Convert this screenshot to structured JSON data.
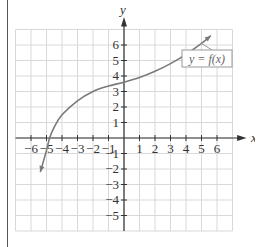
{
  "chart_data": {
    "type": "line",
    "title": "",
    "xlabel": "x",
    "ylabel": "y",
    "xlim": [
      -7,
      7
    ],
    "ylim": [
      -6,
      7
    ],
    "grid": true,
    "x_ticks": [
      -6,
      -5,
      -4,
      -3,
      -2,
      -1,
      1,
      2,
      3,
      4,
      5,
      6
    ],
    "y_ticks": [
      -5,
      -4,
      -3,
      -2,
      -1,
      1,
      2,
      3,
      4,
      5,
      6
    ],
    "x_tick_labels": [
      "−6",
      "−5",
      "−4",
      "−3",
      "−2",
      "−1",
      "1",
      "2",
      "3",
      "4",
      "5",
      "6"
    ],
    "y_tick_labels": [
      "−5",
      "−4",
      "−3",
      "−2",
      "−1",
      "1",
      "2",
      "3",
      "4",
      "5",
      "6"
    ],
    "series": [
      {
        "name": "y = f(x)",
        "x": [
          -5.4,
          -5.0,
          -4.8,
          -4.5,
          -4.0,
          -3.0,
          -2.0,
          -1.0,
          0.0,
          1.0,
          2.0,
          3.0,
          4.0,
          5.0,
          5.6
        ],
        "y": [
          -2.2,
          -0.8,
          0.0,
          0.7,
          1.5,
          2.4,
          3.0,
          3.35,
          3.6,
          3.9,
          4.3,
          4.8,
          5.4,
          6.1,
          6.6
        ],
        "arrows_at_ends": true,
        "color": "#7a7a7a"
      }
    ],
    "annotations": [
      {
        "text": "y = f(x)",
        "boxed": true,
        "points_to": [
          5.0,
          6.1
        ]
      }
    ]
  },
  "colors": {
    "grid": "#d9d9d9",
    "axis": "#333333",
    "curve": "#7a7a7a",
    "label_box": "#999999"
  }
}
